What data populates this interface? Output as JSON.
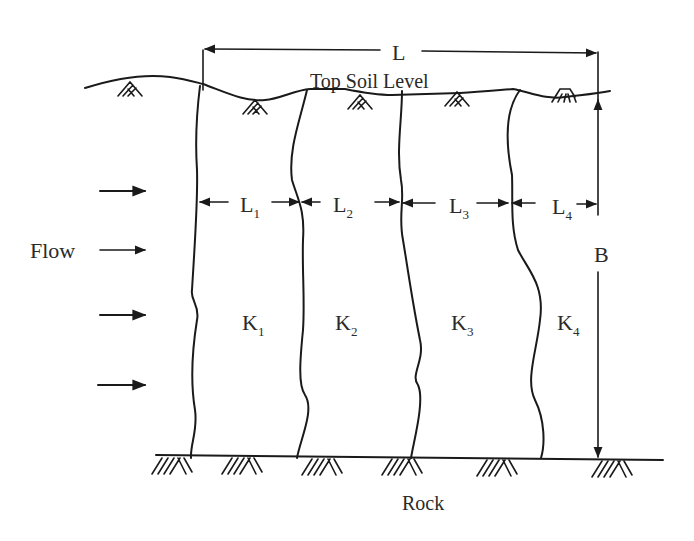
{
  "diagram": {
    "labels": {
      "total_length": "L",
      "top_soil": "Top Soil Level",
      "flow": "Flow",
      "thickness": "B",
      "rock": "Rock"
    },
    "layers": [
      {
        "length_main": "L",
        "length_sub": "1",
        "perm_main": "K",
        "perm_sub": "1"
      },
      {
        "length_main": "L",
        "length_sub": "2",
        "perm_main": "K",
        "perm_sub": "2"
      },
      {
        "length_main": "L",
        "length_sub": "3",
        "perm_main": "K",
        "perm_sub": "3"
      },
      {
        "length_main": "L",
        "length_sub": "4",
        "perm_main": "K",
        "perm_sub": "4"
      }
    ],
    "flow_arrow_count": 4,
    "colors": {
      "ink": "#1a1a1a",
      "text": "#2a2a2a",
      "background": "#ffffff"
    }
  }
}
